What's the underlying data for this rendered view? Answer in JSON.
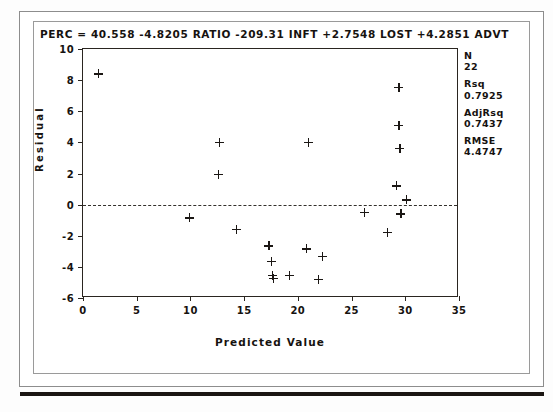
{
  "equation": "PERC = 40.558 -4.8205 RATIO -209.31 INFT +2.7548 LOST +4.2851 ADVT",
  "axis": {
    "xlabel": "Predicted Value",
    "ylabel": "Residual",
    "xticks": [
      "0",
      "5",
      "10",
      "15",
      "20",
      "25",
      "30",
      "35"
    ],
    "yticks": [
      "10",
      "8",
      "6",
      "4",
      "2",
      "0",
      "-2",
      "-4",
      "-6"
    ]
  },
  "stats": [
    {
      "name": "N",
      "value": "22"
    },
    {
      "name": "Rsq",
      "value": "0.7925"
    },
    {
      "name": "AdjRsq",
      "value": "0.7437"
    },
    {
      "name": "RMSE",
      "value": "4.4747"
    }
  ],
  "chart_data": {
    "type": "scatter",
    "title": "PERC = 40.558 -4.8205 RATIO -209.31 INFT +2.7548 LOST +4.2851 ADVT",
    "xlabel": "Predicted Value",
    "ylabel": "Residual",
    "xlim": [
      0,
      35
    ],
    "ylim": [
      -6,
      10
    ],
    "xtick_values": [
      0,
      5,
      10,
      15,
      20,
      25,
      30,
      35
    ],
    "ytick_values": [
      10,
      8,
      6,
      4,
      2,
      0,
      -2,
      -4,
      -6
    ],
    "grid": false,
    "legend": false,
    "reference_line": {
      "orientation": "horizontal",
      "y": 0,
      "style": "dashed"
    },
    "marker": "plus",
    "n_points": 22,
    "points": [
      {
        "x": 1.4,
        "y": 8.4
      },
      {
        "x": 9.9,
        "y": -0.85
      },
      {
        "x": 12.7,
        "y": 4.0
      },
      {
        "x": 12.6,
        "y": 1.95
      },
      {
        "x": 14.3,
        "y": -1.6
      },
      {
        "x": 17.3,
        "y": -2.65
      },
      {
        "x": 17.5,
        "y": -3.65
      },
      {
        "x": 17.6,
        "y": -4.55
      },
      {
        "x": 17.7,
        "y": -4.75
      },
      {
        "x": 19.2,
        "y": -4.55
      },
      {
        "x": 20.8,
        "y": -2.85
      },
      {
        "x": 21.0,
        "y": 4.0
      },
      {
        "x": 21.9,
        "y": -4.8
      },
      {
        "x": 22.3,
        "y": -3.35
      },
      {
        "x": 26.2,
        "y": -0.5
      },
      {
        "x": 28.3,
        "y": -1.8
      },
      {
        "x": 29.2,
        "y": 1.2
      },
      {
        "x": 29.4,
        "y": 7.55
      },
      {
        "x": 29.4,
        "y": 5.1
      },
      {
        "x": 29.5,
        "y": 3.6
      },
      {
        "x": 29.6,
        "y": -0.6
      },
      {
        "x": 30.1,
        "y": 0.3
      }
    ]
  }
}
